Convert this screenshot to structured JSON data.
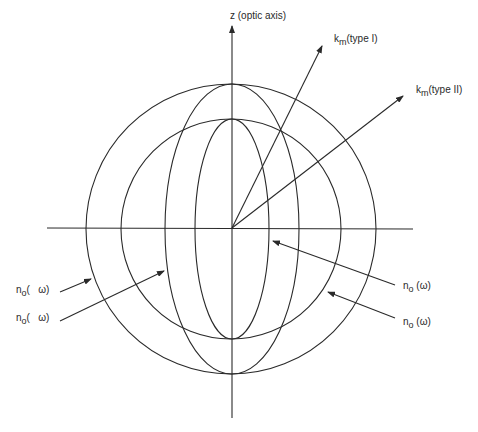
{
  "figure": {
    "type": "index-ellipsoid-phase-matching",
    "axes": {
      "z_label": "z (optic axis)"
    },
    "vectors": [
      {
        "id": "type1",
        "label_main": "k",
        "label_sub": "m",
        "label_suffix": "(type I)"
      },
      {
        "id": "type2",
        "label_main": "k",
        "label_sub": "m",
        "label_suffix": "(type II)"
      }
    ],
    "left_labels": [
      {
        "main": "n",
        "sub": "o",
        "suffix": "(   ω)"
      },
      {
        "main": "n",
        "sub": "o",
        "suffix": "(   ω)"
      }
    ],
    "right_labels": [
      {
        "main": "n",
        "sub": "o",
        "suffix": " (ω)"
      },
      {
        "main": "n",
        "sub": "o",
        "suffix": " (ω)"
      }
    ],
    "colors": {
      "stroke": "#2a2a2a",
      "background": "#ffffff"
    }
  }
}
